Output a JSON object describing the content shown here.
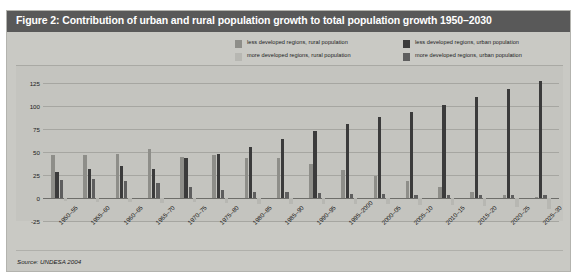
{
  "figure": {
    "title": "Figure 2: Contribution of urban and rural population growth to total population growth 1950–2030",
    "source": "Source: UNDESA 2004",
    "title_bar_color": "#595959",
    "panel_color": "#c9c9c4"
  },
  "legend": {
    "items": [
      {
        "label": "less developed regions, rural population",
        "color": "#8e8e89",
        "column": "left"
      },
      {
        "label": "more developed regions, rural population",
        "color": "#b7b7b2",
        "column": "left"
      },
      {
        "label": "less developed regions, urban population",
        "color": "#3b3b3b",
        "column": "right"
      },
      {
        "label": "more developed regions, urban population",
        "color": "#5e5e5e",
        "column": "right"
      }
    ]
  },
  "chart_data": {
    "type": "bar",
    "title": "Contribution of urban and rural population growth to total population growth 1950–2030",
    "xlabel": "",
    "ylabel": "%",
    "ylim": [
      -25,
      137
    ],
    "yticks": [
      -25,
      0,
      25,
      50,
      75,
      100,
      125
    ],
    "grid": true,
    "legend_position": "top-right",
    "categories": [
      "1950–55",
      "1955–60",
      "1960–65",
      "1965–70",
      "1970–75",
      "1975–80",
      "1980–85",
      "1985–90",
      "1990–95",
      "1995–2000",
      "2000–05",
      "2005–10",
      "2010–15",
      "2015–20",
      "2020–25",
      "2025–30"
    ],
    "series": [
      {
        "name": "less developed regions, rural population",
        "color": "#8e8e89",
        "values": [
          47,
          47,
          48,
          53,
          45,
          47,
          44,
          43,
          37,
          30,
          24,
          18,
          12,
          7,
          3,
          1
        ]
      },
      {
        "name": "less developed regions, urban population",
        "color": "#3b3b3b",
        "values": [
          28,
          31,
          35,
          32,
          43,
          48,
          55,
          64,
          73,
          81,
          88,
          94,
          101,
          110,
          118,
          127
        ]
      },
      {
        "name": "more developed regions, urban population",
        "color": "#5e5e5e",
        "values": [
          20,
          21,
          19,
          16,
          12,
          9,
          7,
          6,
          5,
          4,
          4,
          3,
          3,
          3,
          3,
          3
        ]
      },
      {
        "name": "more developed regions, rural population",
        "color": "#b7b7b2",
        "values": [
          -3,
          -4,
          -4,
          -5,
          -4,
          -5,
          -6,
          -6,
          -7,
          -7,
          -7,
          -8,
          -8,
          -9,
          -10,
          -12
        ]
      }
    ]
  }
}
